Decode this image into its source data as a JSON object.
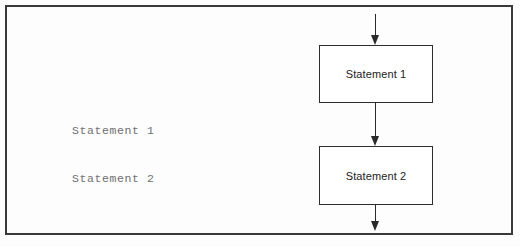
{
  "figure": {
    "kind": "flowchart-sequence-diagram",
    "background_color": "#fdfdfd",
    "frame_border_color": "#3a3a3a",
    "line_color": "#2a2a2a"
  },
  "code_listing": {
    "text_color": "#6f6f6f",
    "lines": [
      "Statement 1",
      "Statement 2"
    ]
  },
  "flowchart": {
    "box_border_color": "#2d2d2d",
    "box_fill_color": "#ffffff",
    "label_color": "#222222",
    "nodes": [
      {
        "id": "statement-1",
        "label": "Statement 1"
      },
      {
        "id": "statement-2",
        "label": "Statement 2"
      }
    ],
    "arrows": [
      {
        "id": "arrow-top",
        "from": "entry",
        "to": "statement-1",
        "direction": "down"
      },
      {
        "id": "arrow-middle",
        "from": "statement-1",
        "to": "statement-2",
        "direction": "down"
      },
      {
        "id": "arrow-bottom",
        "from": "statement-2",
        "to": "exit",
        "direction": "down"
      }
    ]
  }
}
